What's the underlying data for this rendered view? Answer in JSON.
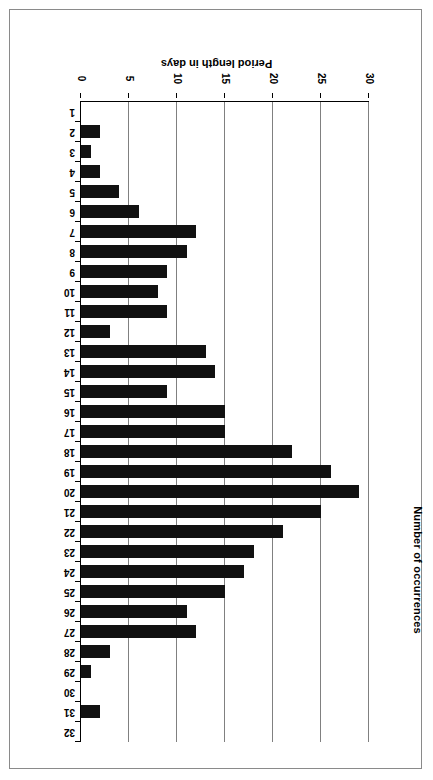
{
  "figure": {
    "orientation": "rotated-180",
    "frame_border_color": "#8a8a8a",
    "bar_color": "#111111",
    "gridline_color": "#808080"
  },
  "axes": {
    "category_axis_title": "Period length in days",
    "value_axis_title": "Number of occurrences",
    "value_ticks": [
      "0",
      "5",
      "10",
      "15",
      "20",
      "25",
      "30"
    ],
    "category_ticks": [
      "1",
      "2",
      "3",
      "4",
      "5",
      "6",
      "7",
      "8",
      "9",
      "10",
      "11",
      "12",
      "13",
      "14",
      "15",
      "16",
      "17",
      "18",
      "19",
      "20",
      "21",
      "22",
      "23",
      "24",
      "25",
      "26",
      "27",
      "28",
      "29",
      "30",
      "31",
      "32"
    ]
  },
  "chart_data": {
    "type": "bar",
    "title": "",
    "xlabel": "Period length in days",
    "ylabel": "Number of occurrences",
    "orientation": "horizontal",
    "xlim": [
      0,
      30
    ],
    "grid": true,
    "legend": "none",
    "categories": [
      "1",
      "2",
      "3",
      "4",
      "5",
      "6",
      "7",
      "8",
      "9",
      "10",
      "11",
      "12",
      "13",
      "14",
      "15",
      "16",
      "17",
      "18",
      "19",
      "20",
      "21",
      "22",
      "23",
      "24",
      "25",
      "26",
      "27",
      "28",
      "29",
      "30",
      "31",
      "32"
    ],
    "values": [
      0,
      2,
      1,
      2,
      4,
      6,
      12,
      11,
      9,
      8,
      9,
      3,
      13,
      14,
      9,
      15,
      15,
      22,
      26,
      29,
      25,
      21,
      18,
      17,
      15,
      11,
      12,
      3,
      1,
      0,
      2,
      0
    ]
  }
}
